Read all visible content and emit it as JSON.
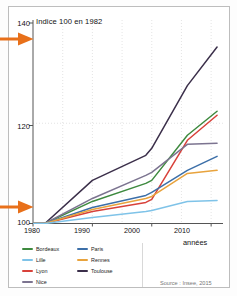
{
  "figure": {
    "axis_title": "Indice 100 en 1982",
    "xaxis_label": "années",
    "source": "Source : Insee, 2015",
    "annotation_arrow_color": "#E8701A",
    "arrows": [
      {
        "name": "arrow-top",
        "points_to": "140"
      },
      {
        "name": "arrow-bottom",
        "points_to": "100"
      }
    ]
  },
  "legend": {
    "column_a": [
      {
        "label": "Bordeaux",
        "color": "#3E8A3F"
      },
      {
        "label": "Lille",
        "color": "#7FC3E8"
      },
      {
        "label": "Lyon",
        "color": "#D8413A"
      },
      {
        "label": "Nice",
        "color": "#7C7490"
      }
    ],
    "column_b": [
      {
        "label": "Paris",
        "color": "#3C6FA8"
      },
      {
        "label": "Rennes",
        "color": "#E8A33D"
      },
      {
        "label": "Toulouse",
        "color": "#3B2F4A"
      }
    ]
  },
  "chart_data": {
    "type": "line",
    "title": "Indice 100 en 1982",
    "xlabel": "années",
    "ylabel": "Indice 100 en 1982",
    "xlim": [
      1980,
      2012
    ],
    "ylim": [
      100,
      140
    ],
    "yticks": [
      100,
      120,
      140
    ],
    "xticks": [
      1980,
      1990,
      2000,
      2010
    ],
    "grid": "vertical-dotted",
    "legend_position": "bottom-left",
    "source": "Source : Insee, 2015",
    "x": [
      1980,
      1982,
      1990,
      1999,
      2000,
      2006,
      2011
    ],
    "series": [
      {
        "name": "Toulouse",
        "color": "#3B2F4A",
        "values": [
          100,
          100,
          108.6,
          113.6,
          115.0,
          127.5,
          135.2
        ]
      },
      {
        "name": "Bordeaux",
        "color": "#3E8A3F",
        "values": [
          100,
          100,
          104.4,
          108.0,
          108.6,
          117.6,
          122.4
        ]
      },
      {
        "name": "Lyon",
        "color": "#D8413A",
        "values": [
          100,
          100,
          102.4,
          104.2,
          104.8,
          116.6,
          121.6
        ]
      },
      {
        "name": "Nice",
        "color": "#7C7490",
        "values": [
          100,
          100,
          105.0,
          109.6,
          110.2,
          115.8,
          116.0
        ]
      },
      {
        "name": "Paris",
        "color": "#3C6FA8",
        "values": [
          100,
          100,
          103.2,
          105.6,
          106.2,
          110.6,
          113.4
        ]
      },
      {
        "name": "Rennes",
        "color": "#E8A33D",
        "values": [
          100,
          100,
          102.8,
          105.0,
          105.4,
          110.0,
          110.6
        ]
      },
      {
        "name": "Lille",
        "color": "#7FC3E8",
        "values": [
          100,
          100,
          101.2,
          102.4,
          102.6,
          104.4,
          104.6
        ]
      }
    ]
  }
}
